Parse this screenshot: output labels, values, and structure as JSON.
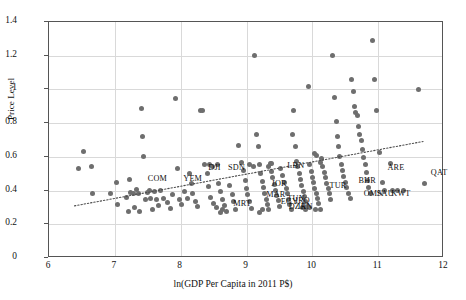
{
  "chart_data": {
    "type": "scatter",
    "title": "",
    "xlabel": "ln(GDP Per Capita in 2011 P$)",
    "ylabel": "Price Level",
    "xlim": [
      6,
      12
    ],
    "ylim": [
      0,
      1.4
    ],
    "xticks": [
      "6",
      "7",
      "8",
      "9",
      "10",
      "11",
      "12"
    ],
    "yticks": [
      "0",
      "0.2",
      "0.4",
      "0.6",
      "0.8",
      "1",
      "1.2",
      "1.4"
    ],
    "grid": "both",
    "legend": "none",
    "marker_color": "#6e6e6e",
    "trendline": {
      "style": "dotted",
      "color": "#4d4d4d",
      "x0": 6.38,
      "y0": 0.3,
      "x1": 11.72,
      "y1": 0.685
    },
    "points": [
      [
        6.52,
        0.63
      ],
      [
        6.45,
        0.53
      ],
      [
        6.64,
        0.545
      ],
      [
        6.66,
        0.38
      ],
      [
        6.93,
        0.38
      ],
      [
        7.02,
        0.445
      ],
      [
        7.04,
        0.315
      ],
      [
        7.18,
        0.36
      ],
      [
        7.2,
        0.275
      ],
      [
        7.23,
        0.465
      ],
      [
        7.24,
        0.39
      ],
      [
        7.28,
        0.385
      ],
      [
        7.3,
        0.3
      ],
      [
        7.33,
        0.405
      ],
      [
        7.36,
        0.38
      ],
      [
        7.38,
        0.275
      ],
      [
        7.4,
        0.885
      ],
      [
        7.42,
        0.72
      ],
      [
        7.44,
        0.605
      ],
      [
        7.46,
        0.345
      ],
      [
        7.49,
        0.39
      ],
      [
        7.52,
        0.4
      ],
      [
        7.54,
        0.355
      ],
      [
        7.57,
        0.29
      ],
      [
        7.6,
        0.395
      ],
      [
        7.63,
        0.345
      ],
      [
        7.66,
        0.31
      ],
      [
        7.7,
        0.4
      ],
      [
        7.74,
        0.355
      ],
      [
        7.8,
        0.33
      ],
      [
        7.84,
        0.295
      ],
      [
        7.88,
        0.375
      ],
      [
        7.92,
        0.945
      ],
      [
        7.95,
        0.53
      ],
      [
        7.98,
        0.345
      ],
      [
        8.02,
        0.315
      ],
      [
        8.06,
        0.395
      ],
      [
        8.1,
        0.355
      ],
      [
        8.14,
        0.5
      ],
      [
        8.16,
        0.44
      ],
      [
        8.18,
        0.385
      ],
      [
        8.22,
        0.335
      ],
      [
        8.26,
        0.305
      ],
      [
        8.3,
        0.875
      ],
      [
        8.33,
        0.875
      ],
      [
        8.36,
        0.555
      ],
      [
        8.4,
        0.5
      ],
      [
        8.42,
        0.425
      ],
      [
        8.46,
        0.36
      ],
      [
        8.5,
        0.325
      ],
      [
        8.54,
        0.3
      ],
      [
        8.56,
        0.555
      ],
      [
        8.58,
        0.44
      ],
      [
        8.6,
        0.395
      ],
      [
        8.63,
        0.345
      ],
      [
        8.66,
        0.31
      ],
      [
        8.7,
        0.275
      ],
      [
        8.74,
        0.43
      ],
      [
        8.78,
        0.375
      ],
      [
        8.8,
        0.335
      ],
      [
        8.84,
        0.29
      ],
      [
        8.88,
        0.67
      ],
      [
        8.92,
        0.565
      ],
      [
        8.95,
        0.52
      ],
      [
        8.98,
        0.46
      ],
      [
        9.0,
        0.41
      ],
      [
        9.02,
        0.375
      ],
      [
        9.05,
        0.335
      ],
      [
        9.08,
        0.295
      ],
      [
        9.12,
        1.2
      ],
      [
        9.15,
        0.73
      ],
      [
        9.18,
        0.66
      ],
      [
        9.2,
        0.555
      ],
      [
        9.22,
        0.5
      ],
      [
        9.24,
        0.455
      ],
      [
        9.26,
        0.42
      ],
      [
        9.28,
        0.385
      ],
      [
        9.3,
        0.35
      ],
      [
        9.32,
        0.315
      ],
      [
        9.34,
        0.285
      ],
      [
        9.36,
        0.56
      ],
      [
        9.38,
        0.515
      ],
      [
        9.4,
        0.475
      ],
      [
        9.42,
        0.435
      ],
      [
        9.44,
        0.4
      ],
      [
        9.46,
        0.37
      ],
      [
        9.48,
        0.34
      ],
      [
        9.5,
        0.305
      ],
      [
        9.52,
        0.53
      ],
      [
        9.55,
        0.49
      ],
      [
        9.58,
        0.45
      ],
      [
        9.6,
        0.415
      ],
      [
        9.62,
        0.38
      ],
      [
        9.64,
        0.35
      ],
      [
        9.66,
        0.32
      ],
      [
        9.68,
        0.29
      ],
      [
        9.7,
        0.735
      ],
      [
        9.72,
        0.875
      ],
      [
        9.74,
        0.66
      ],
      [
        9.76,
        0.575
      ],
      [
        9.78,
        0.54
      ],
      [
        9.8,
        0.5
      ],
      [
        9.82,
        0.465
      ],
      [
        9.84,
        0.43
      ],
      [
        9.86,
        0.395
      ],
      [
        9.88,
        0.365
      ],
      [
        9.9,
        0.335
      ],
      [
        9.92,
        0.305
      ],
      [
        9.94,
        1.02
      ],
      [
        9.96,
        0.555
      ],
      [
        9.98,
        0.515
      ],
      [
        10.0,
        0.48
      ],
      [
        10.02,
        0.45
      ],
      [
        10.04,
        0.415
      ],
      [
        10.06,
        0.385
      ],
      [
        10.08,
        0.355
      ],
      [
        10.1,
        0.325
      ],
      [
        10.12,
        0.29
      ],
      [
        10.14,
        0.59
      ],
      [
        10.16,
        0.545
      ],
      [
        10.18,
        0.51
      ],
      [
        10.2,
        0.475
      ],
      [
        10.22,
        0.44
      ],
      [
        10.24,
        0.41
      ],
      [
        10.26,
        0.38
      ],
      [
        10.28,
        0.35
      ],
      [
        10.3,
        1.2
      ],
      [
        10.33,
        0.95
      ],
      [
        10.36,
        0.81
      ],
      [
        10.38,
        0.72
      ],
      [
        10.4,
        0.66
      ],
      [
        10.42,
        0.6
      ],
      [
        10.44,
        0.555
      ],
      [
        10.46,
        0.52
      ],
      [
        10.48,
        0.485
      ],
      [
        10.5,
        0.45
      ],
      [
        10.52,
        0.42
      ],
      [
        10.55,
        0.385
      ],
      [
        10.58,
        0.355
      ],
      [
        10.6,
        1.06
      ],
      [
        10.62,
        0.985
      ],
      [
        10.64,
        0.9
      ],
      [
        10.66,
        0.865
      ],
      [
        10.68,
        0.845
      ],
      [
        10.7,
        0.78
      ],
      [
        10.72,
        0.735
      ],
      [
        10.74,
        0.695
      ],
      [
        10.76,
        0.645
      ],
      [
        10.78,
        0.595
      ],
      [
        10.8,
        0.555
      ],
      [
        10.82,
        0.505
      ],
      [
        10.84,
        0.46
      ],
      [
        10.86,
        0.42
      ],
      [
        10.88,
        0.385
      ],
      [
        10.92,
        1.29
      ],
      [
        10.95,
        1.06
      ],
      [
        10.98,
        0.875
      ],
      [
        11.02,
        0.625
      ],
      [
        11.06,
        0.45
      ],
      [
        11.1,
        0.4
      ],
      [
        11.18,
        0.56
      ],
      [
        11.22,
        0.4
      ],
      [
        11.3,
        0.4
      ],
      [
        11.38,
        0.4
      ],
      [
        11.62,
        1.0
      ],
      [
        11.7,
        0.44
      ],
      [
        9.05,
        0.555
      ],
      [
        9.1,
        0.54
      ],
      [
        8.44,
        0.555
      ],
      [
        8.48,
        0.545
      ],
      [
        9.33,
        0.545
      ],
      [
        9.38,
        0.56
      ],
      [
        10.03,
        0.62
      ],
      [
        10.07,
        0.61
      ],
      [
        10.12,
        0.565
      ],
      [
        9.85,
        0.3
      ],
      [
        9.9,
        0.285
      ],
      [
        9.95,
        0.3
      ],
      [
        10.05,
        0.285
      ],
      [
        8.6,
        0.27
      ],
      [
        8.64,
        0.285
      ],
      [
        9.2,
        0.27
      ],
      [
        9.25,
        0.285
      ]
    ],
    "annotations": [
      {
        "label": "COM",
        "x": 7.5,
        "y": 0.468
      },
      {
        "label": "YEM",
        "x": 8.04,
        "y": 0.468
      },
      {
        "label": "DJI",
        "x": 8.42,
        "y": 0.532
      },
      {
        "label": "SDN",
        "x": 8.72,
        "y": 0.532
      },
      {
        "label": "MRT",
        "x": 8.8,
        "y": 0.318
      },
      {
        "label": "LBN",
        "x": 9.62,
        "y": 0.545
      },
      {
        "label": "JOR",
        "x": 9.38,
        "y": 0.438
      },
      {
        "label": "MAR",
        "x": 9.3,
        "y": 0.372
      },
      {
        "label": "EGY",
        "x": 9.52,
        "y": 0.332
      },
      {
        "label": "TUN",
        "x": 9.62,
        "y": 0.352
      },
      {
        "label": "IRQ",
        "x": 9.74,
        "y": 0.338
      },
      {
        "label": "DZA",
        "x": 9.64,
        "y": 0.305
      },
      {
        "label": "IRN",
        "x": 9.78,
        "y": 0.3
      },
      {
        "label": "TUR",
        "x": 10.26,
        "y": 0.43
      },
      {
        "label": "BHR",
        "x": 10.7,
        "y": 0.455
      },
      {
        "label": "OMN",
        "x": 10.78,
        "y": 0.382
      },
      {
        "label": "SAU",
        "x": 10.98,
        "y": 0.382
      },
      {
        "label": "KWT",
        "x": 11.2,
        "y": 0.382
      },
      {
        "label": "ARE",
        "x": 11.14,
        "y": 0.532
      },
      {
        "label": "QAT",
        "x": 11.8,
        "y": 0.505
      }
    ]
  }
}
